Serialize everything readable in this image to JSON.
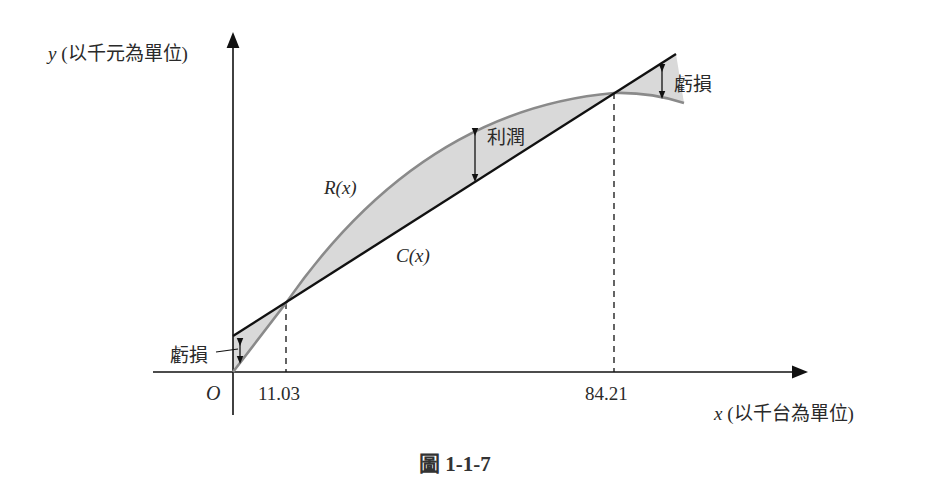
{
  "figure": {
    "caption": "圖 1-1-7",
    "y_axis_label_var": "y",
    "y_axis_label_unit": "(以千元為單位)",
    "x_axis_label_var": "x",
    "x_axis_label_unit": "(以千台為單位)",
    "origin_label": "O",
    "tick_1": "11.03",
    "tick_2": "84.21",
    "curve_R_label": "R(x)",
    "curve_C_label": "C(x)",
    "loss_label_left": "虧損",
    "profit_label": "利潤",
    "loss_label_right": "虧損",
    "colors": {
      "revenue_curve": "#8a8a8a",
      "cost_line": "#111111",
      "shading": "#d9d9d9",
      "axes": "#111111"
    }
  }
}
